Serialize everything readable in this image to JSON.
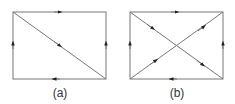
{
  "figure": {
    "panels": [
      {
        "id": "a",
        "label": "(a)",
        "rect": {
          "x1": 13,
          "y1": 12,
          "x2": 106,
          "y2": 79
        },
        "edges": [
          {
            "name": "top",
            "from": "top-left",
            "to": "top-right",
            "arrow": "right"
          },
          {
            "name": "bottom",
            "from": "bottom-right",
            "to": "bottom-left",
            "arrow": "left"
          },
          {
            "name": "left",
            "from": "bottom-left",
            "to": "top-left",
            "arrow": "up"
          },
          {
            "name": "right",
            "from": "bottom-right",
            "to": "top-right",
            "arrow": "up"
          },
          {
            "name": "diagonal",
            "from": "top-left",
            "to": "bottom-right",
            "arrow": "down-right"
          }
        ]
      },
      {
        "id": "b",
        "label": "(b)",
        "rect": {
          "x1": 130,
          "y1": 12,
          "x2": 223,
          "y2": 79
        },
        "edges": [
          {
            "name": "top",
            "from": "top-left",
            "to": "top-right",
            "arrow": "right"
          },
          {
            "name": "bottom",
            "from": "bottom-right",
            "to": "bottom-left",
            "arrow": "left"
          },
          {
            "name": "left",
            "from": "bottom-left",
            "to": "top-left",
            "arrow": "up"
          },
          {
            "name": "right",
            "from": "bottom-right",
            "to": "top-right",
            "arrow": "up"
          },
          {
            "name": "diagonal-1",
            "from": "top-left",
            "to": "bottom-right",
            "arrow": "down-right"
          },
          {
            "name": "diagonal-2",
            "from": "bottom-left",
            "to": "top-right",
            "arrow": "up-right"
          }
        ]
      }
    ],
    "colors": {
      "line": "#777777",
      "arrow": "#222222",
      "label": "#333333"
    }
  }
}
